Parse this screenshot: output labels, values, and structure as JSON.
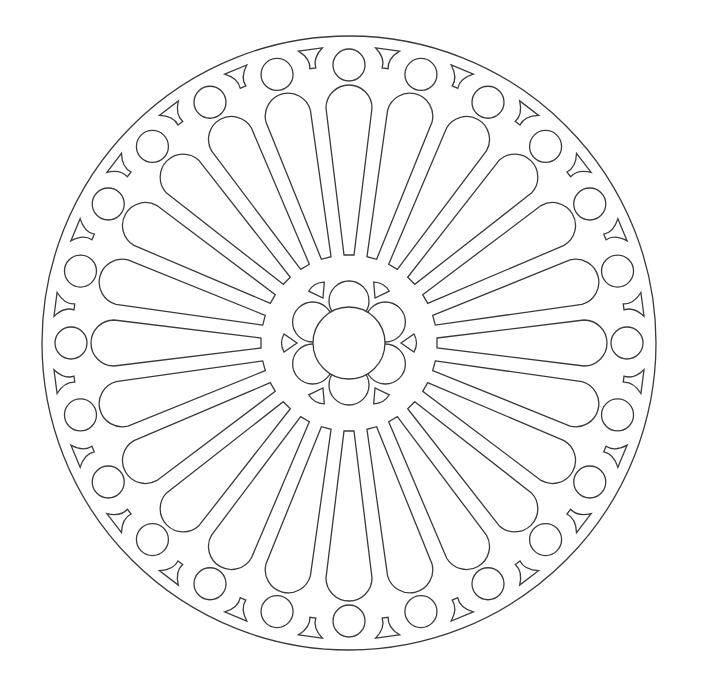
{
  "title": "Rose window line drawing",
  "drawing": {
    "stroke_color": "#3a3a3a",
    "background": "#ffffff",
    "center": [
      349,
      343
    ],
    "outer_circle_radius": 307,
    "petal_count": 24,
    "petal": {
      "inner_radius": 88,
      "outer_radius": 258,
      "inner_half_width": 5,
      "outer_half_width": 23
    },
    "small_circles": {
      "count": 24,
      "ring_radius": 278,
      "radius": 16
    },
    "wedges": {
      "count": 24,
      "ring_radius": 294
    },
    "center_rosette": {
      "center_radius": 36,
      "lobe_count": 6,
      "lobe_ring_radius": 42,
      "lobe_radius": 20,
      "triangle_count": 6,
      "triangle_ring_radius": 62
    }
  }
}
